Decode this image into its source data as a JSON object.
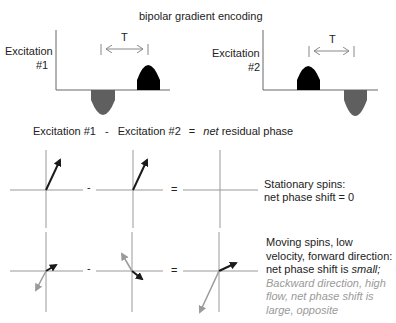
{
  "title": "bipolar gradient encoding",
  "excitation1": {
    "label_line1": "Excitation",
    "label_line2": "#1",
    "interval_label": "T"
  },
  "excitation2": {
    "label_line1": "Excitation",
    "label_line2": "#2",
    "interval_label": "T"
  },
  "equation": {
    "term1": "Excitation #1",
    "minus": "-",
    "term2": "Excitation #2",
    "equals": "=",
    "result_italic": "net",
    "result_rest": "residual phase"
  },
  "row1": {
    "minus": "-",
    "equals": "=",
    "caption_line1": "Stationary spins:",
    "caption_line2": "net phase shift = 0"
  },
  "row2": {
    "minus": "-",
    "equals": "=",
    "caption_line1": "Moving spins, low",
    "caption_line2": "velocity, forward direction:",
    "caption_line3_prefix": "net phase shift is ",
    "caption_line3_italic": "small;",
    "caption_gray_line1": "Backward direction, high",
    "caption_gray_line2": "flow, net phase shift is",
    "caption_gray_line3": "large, opposite"
  },
  "colors": {
    "black_lobe": "#000000",
    "gray_lobe": "#5f5f5f",
    "axis": "#888888",
    "gray_arrow": "#9a9a9a",
    "arrow": "#1a1a1a"
  }
}
